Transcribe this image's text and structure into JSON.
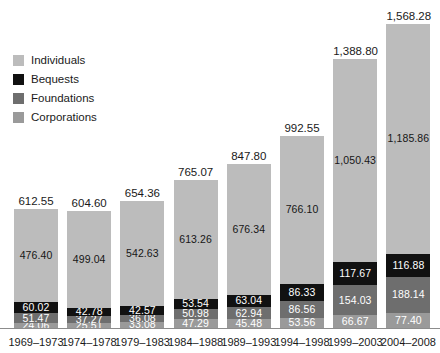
{
  "chart_data": {
    "type": "bar",
    "subtype": "stacked-bar",
    "title": "",
    "subtitle": "",
    "xlabel": "",
    "ylabel": "",
    "grid": false,
    "legend_position": "top-left",
    "ylim": [
      0,
      1568.28
    ],
    "categories": [
      "1969–1973",
      "1974–1978",
      "1979–1983",
      "1984–1988",
      "1989–1993",
      "1994–1998",
      "1999–2003",
      "2004–2008"
    ],
    "series": [
      {
        "name": "Corporations",
        "color": "#9a9a9a",
        "values": [
          24.06,
          25.51,
          33.08,
          47.29,
          45.48,
          53.56,
          66.67,
          77.4
        ],
        "labels": [
          "24.06",
          "25.51",
          "33.08",
          "47.29",
          "45.48",
          "53.56",
          "66.67",
          "77.40"
        ]
      },
      {
        "name": "Foundations",
        "color": "#6e6e6e",
        "values": [
          51.47,
          37.27,
          36.08,
          50.98,
          62.94,
          86.56,
          154.03,
          188.14
        ],
        "labels": [
          "51.47",
          "37.27",
          "36.08",
          "50.98",
          "62.94",
          "86.56",
          "154.03",
          "188.14"
        ]
      },
      {
        "name": "Bequests",
        "color": "#111111",
        "values": [
          60.02,
          42.78,
          42.57,
          53.54,
          63.04,
          86.33,
          117.67,
          116.88
        ],
        "labels": [
          "60.02",
          "42.78",
          "42.57",
          "53.54",
          "63.04",
          "86.33",
          "117.67",
          "116.88"
        ]
      },
      {
        "name": "Individuals",
        "color": "#bcbcbc",
        "values": [
          476.4,
          499.04,
          542.63,
          613.26,
          676.34,
          766.1,
          1050.43,
          1185.86
        ],
        "labels": [
          "476.40",
          "499.04",
          "542.63",
          "613.26",
          "676.34",
          "766.10",
          "1,050.43",
          "1,185.86"
        ]
      }
    ],
    "totals": [
      612.55,
      604.6,
      654.36,
      765.07,
      847.8,
      992.55,
      1388.8,
      1568.28
    ],
    "total_labels": [
      "612.55",
      "604.60",
      "654.36",
      "765.07",
      "847.80",
      "992.55",
      "1,388.80",
      "1,568.28"
    ]
  },
  "legend": {
    "items": [
      {
        "label": "Individuals",
        "color": "#bcbcbc"
      },
      {
        "label": "Bequests",
        "color": "#111111"
      },
      {
        "label": "Foundations",
        "color": "#6e6e6e"
      },
      {
        "label": "Corporations",
        "color": "#9a9a9a"
      }
    ]
  }
}
